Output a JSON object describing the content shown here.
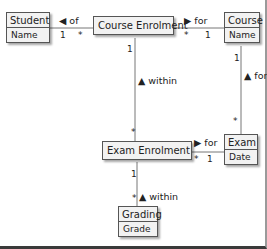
{
  "diagram": {
    "type": "UML class diagram",
    "classes": [
      {
        "id": "student",
        "name": "Student",
        "attributes": [
          "Name"
        ]
      },
      {
        "id": "course_enrolment",
        "name": "Course Enrolment",
        "attributes": []
      },
      {
        "id": "course",
        "name": "Course",
        "attributes": [
          "Name"
        ]
      },
      {
        "id": "exam_enrolment",
        "name": "Exam Enrolment",
        "attributes": []
      },
      {
        "id": "exam",
        "name": "Exam",
        "attributes": [
          "Date"
        ]
      },
      {
        "id": "grading",
        "name": "Grading",
        "attributes": [
          "Grade"
        ]
      }
    ],
    "associations": [
      {
        "from": "course_enrolment",
        "to": "student",
        "label": "of",
        "arrow": "◀",
        "mult_from": "*",
        "mult_to": "1"
      },
      {
        "from": "course_enrolment",
        "to": "course",
        "label": "for",
        "arrow": "▶",
        "mult_from": "*",
        "mult_to": "1"
      },
      {
        "from": "exam_enrolment",
        "to": "course_enrolment",
        "label": "within",
        "arrow": "▲",
        "mult_from": "*",
        "mult_to": "1"
      },
      {
        "from": "exam",
        "to": "course",
        "label": "for",
        "arrow": "▲",
        "mult_from": "*",
        "mult_to": "1"
      },
      {
        "from": "exam_enrolment",
        "to": "exam",
        "label": "for",
        "arrow": "▶",
        "mult_from": "*",
        "mult_to": "1"
      },
      {
        "from": "grading",
        "to": "exam_enrolment",
        "label": "within",
        "arrow": "▲",
        "mult_from": "*",
        "mult_to": "1"
      }
    ]
  },
  "labels": {
    "student": "Student",
    "student_attr": "Name",
    "course_enrolment": "Course Enrolment",
    "course": "Course",
    "course_attr": "Name",
    "exam_enrolment": "Exam Enrolment",
    "exam": "Exam",
    "exam_attr": "Date",
    "grading": "Grading",
    "grading_attr": "Grade",
    "of": "◀ of",
    "for1": "▶ for",
    "within1": "▲ within",
    "for2": "▲ for",
    "for3": "▶ for",
    "within2": "▲ within",
    "one": "1",
    "many": "*"
  }
}
